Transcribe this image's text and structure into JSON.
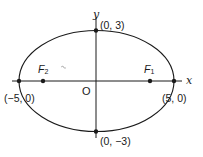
{
  "diagram": {
    "type": "ellipse",
    "equation_params": {
      "a": 5,
      "b": 3
    },
    "axes": {
      "x_label": "x",
      "y_label": "y"
    },
    "origin_label": "O",
    "vertices": [
      {
        "label": "(−5, 0)",
        "role": "left-vertex"
      },
      {
        "label": "(5, 0)",
        "role": "right-vertex"
      },
      {
        "label": "(0, 3)",
        "role": "top-vertex"
      },
      {
        "label": "(0, −3)",
        "role": "bottom-vertex"
      }
    ],
    "foci": [
      {
        "symbol": "F",
        "sub": "1",
        "side": "right"
      },
      {
        "symbol": "F",
        "sub": "2",
        "side": "left"
      }
    ],
    "colors": {
      "stroke": "#1a1a1a",
      "background": "#ffffff"
    }
  }
}
